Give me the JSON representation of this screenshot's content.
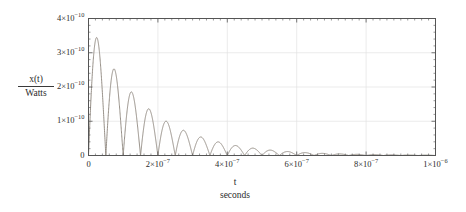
{
  "chart_data": {
    "type": "line",
    "title": "",
    "subtitle": "",
    "xlabel": "t",
    "xunit": "seconds",
    "ylabel_numerator": "x(t)",
    "ylabel_denominator": "Watts",
    "grid": true,
    "legend": "none",
    "xlim": [
      0,
      1e-06
    ],
    "ylim": [
      0,
      4e-10
    ],
    "x_ticks": [
      0,
      2e-07,
      4e-07,
      6e-07,
      8e-07,
      1e-06
    ],
    "x_tick_labels": [
      "0",
      "2×10−7",
      "4×10−7",
      "6×10−7",
      "8×10−7",
      "1×10−6"
    ],
    "y_ticks": [
      0,
      1e-10,
      2e-10,
      3e-10,
      4e-10
    ],
    "y_tick_labels": [
      "0",
      "1×10−10",
      "2×10−10",
      "3×10−10",
      "4×10−10"
    ],
    "series": [
      {
        "name": "x(t)",
        "color": "#8a8279",
        "line_width": 0.9,
        "description": "damped rectified sinusoid, exponentially decaying envelope",
        "model": {
          "amplitude": 4e-10,
          "decay_time_constant": 1.62e-07,
          "period": 5e-08,
          "form": "A * exp(-t/tau) * |sin(pi*t/T)|"
        },
        "peaks": [
          {
            "t": 0.0,
            "y": 4e-10
          },
          {
            "t": 5e-08,
            "y": 2.9e-10
          },
          {
            "t": 1e-07,
            "y": 2.15e-10
          },
          {
            "t": 1.5e-07,
            "y": 1.55e-10
          },
          {
            "t": 2e-07,
            "y": 1.12e-10
          },
          {
            "t": 2.5e-07,
            "y": 8.5e-11
          },
          {
            "t": 3e-07,
            "y": 6.3e-11
          },
          {
            "t": 3.5e-07,
            "y": 4.5e-11
          },
          {
            "t": 4e-07,
            "y": 3.4e-11
          },
          {
            "t": 4.5e-07,
            "y": 2.5e-11
          },
          {
            "t": 5e-07,
            "y": 1.85e-11
          },
          {
            "t": 5.5e-07,
            "y": 1.35e-11
          },
          {
            "t": 6e-07,
            "y": 1e-11
          },
          {
            "t": 6.5e-07,
            "y": 7.2e-12
          },
          {
            "t": 7e-07,
            "y": 5.3e-12
          },
          {
            "t": 7.5e-07,
            "y": 3.9e-12
          },
          {
            "t": 8e-07,
            "y": 2.8e-12
          },
          {
            "t": 8.5e-07,
            "y": 2.1e-12
          },
          {
            "t": 9e-07,
            "y": 1.5e-12
          },
          {
            "t": 9.5e-07,
            "y": 1.1e-12
          },
          {
            "t": 1e-06,
            "y": 8e-13
          }
        ],
        "minima_value": 0.0
      }
    ],
    "frame_color": "#555555",
    "grid_color": "#e2e2e2"
  }
}
